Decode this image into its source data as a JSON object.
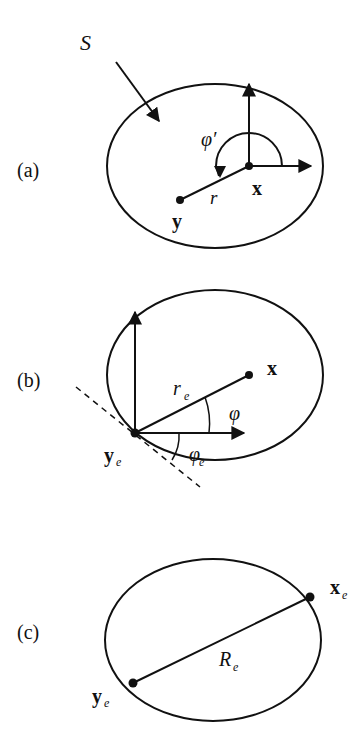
{
  "figure": {
    "panels": [
      {
        "id": "a",
        "label": "(a)",
        "surface_label": "S",
        "points": {
          "field": "x",
          "source": "y"
        },
        "distance_label": "r",
        "angle_label": "φ′"
      },
      {
        "id": "b",
        "label": "(b)",
        "points": {
          "field": "x",
          "edge": "y",
          "edge_sub": "e"
        },
        "distance_label": "r",
        "distance_sub": "e",
        "angle_label": "φ",
        "tangent_angle_label": "φ",
        "tangent_angle_sub": "e"
      },
      {
        "id": "c",
        "label": "(c)",
        "points": {
          "x": "x",
          "x_sub": "e",
          "y": "y",
          "y_sub": "e"
        },
        "distance_label": "R",
        "distance_sub": "e"
      }
    ]
  },
  "colors": {
    "stroke": "#111111",
    "background": "#ffffff"
  }
}
